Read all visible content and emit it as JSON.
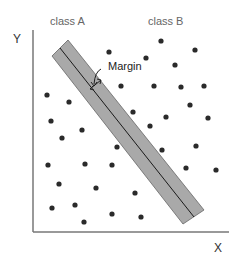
{
  "diagram": {
    "labels": {
      "class_a": "class A",
      "class_b": "class B",
      "y_axis": "Y",
      "x_axis": "X",
      "margin": "Margin"
    },
    "colors": {
      "axis": "#777777",
      "band_fill": "#a9a9a9",
      "band_stroke": "#555555",
      "hyperplane": "#1a1a1a",
      "dot": "#2a2a2a"
    },
    "axes": {
      "origin": [
        33,
        232
      ],
      "y_top": [
        33,
        30
      ],
      "x_right": [
        229,
        232
      ]
    },
    "band": {
      "polygon": [
        [
          52,
          56
        ],
        [
          68,
          40
        ],
        [
          204,
          210
        ],
        [
          183,
          224
        ]
      ],
      "center_line": [
        [
          60,
          48
        ],
        [
          194,
          217
        ]
      ]
    },
    "class_a_points": [
      [
        47,
        95
      ],
      [
        69,
        102
      ],
      [
        51,
        121
      ],
      [
        82,
        130
      ],
      [
        62,
        138
      ],
      [
        117,
        147
      ],
      [
        48,
        165
      ],
      [
        85,
        164
      ],
      [
        112,
        165
      ],
      [
        59,
        184
      ],
      [
        96,
        188
      ],
      [
        52,
        208
      ],
      [
        75,
        205
      ],
      [
        84,
        222
      ],
      [
        112,
        214
      ],
      [
        135,
        193
      ],
      [
        141,
        217
      ]
    ],
    "class_b_points": [
      [
        109,
        52
      ],
      [
        161,
        41
      ],
      [
        195,
        50
      ],
      [
        146,
        58
      ],
      [
        175,
        65
      ],
      [
        121,
        86
      ],
      [
        154,
        86
      ],
      [
        181,
        87
      ],
      [
        204,
        86
      ],
      [
        190,
        105
      ],
      [
        133,
        112
      ],
      [
        166,
        117
      ],
      [
        208,
        118
      ],
      [
        150,
        126
      ],
      [
        162,
        150
      ],
      [
        196,
        146
      ],
      [
        186,
        168
      ],
      [
        216,
        170
      ]
    ]
  }
}
